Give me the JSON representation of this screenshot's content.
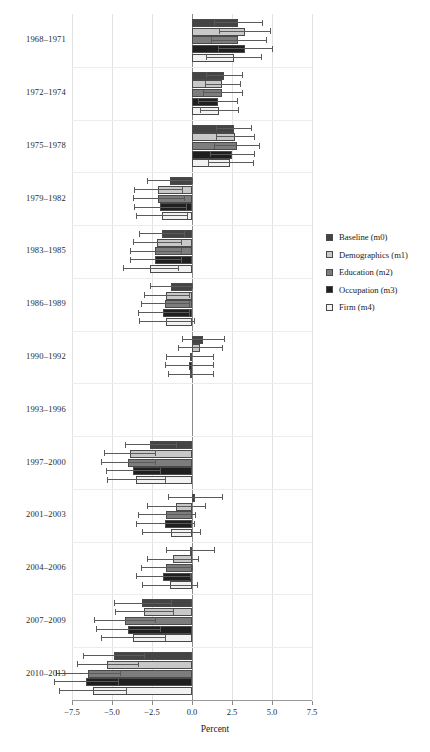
{
  "chart_data": {
    "type": "bar",
    "orientation": "horizontal",
    "title": "",
    "xlabel": "Percent",
    "ylabel": "",
    "xlim": [
      -7.5,
      7.5
    ],
    "xticks": [
      -7.5,
      -5.0,
      -2.5,
      0.0,
      2.5,
      5.0,
      7.5
    ],
    "xtick_labels": [
      "−7.5",
      "−5.0",
      "−2.5",
      "0.0",
      "2.5",
      "5.0",
      "7.5"
    ],
    "grid": true,
    "legend_position": "right",
    "error_bars": true,
    "categories": [
      "1968–1971",
      "1972–1974",
      "1975–1978",
      "1979–1982",
      "1983–1985",
      "1986–1989",
      "1990–1992",
      "1993–1996",
      "1997–2000",
      "2001–2003",
      "2004–2006",
      "2007–2009",
      "2010–2013"
    ],
    "series": [
      {
        "name": "Baseline (m0)",
        "color": "#444444",
        "values": [
          2.9,
          2.0,
          2.6,
          -1.4,
          -1.9,
          -1.3,
          0.7,
          0.0,
          -2.6,
          0.2,
          -0.1,
          -3.1,
          -4.9
        ],
        "ci_low": [
          1.4,
          0.9,
          1.5,
          -2.8,
          -3.3,
          -2.6,
          -0.6,
          0.0,
          -4.2,
          -1.5,
          -1.6,
          -4.9,
          -6.8
        ],
        "ci_high": [
          4.4,
          3.1,
          3.7,
          0.0,
          -0.5,
          0.0,
          2.0,
          0.0,
          -1.0,
          1.9,
          1.4,
          -1.3,
          -3.0
        ]
      },
      {
        "name": "Demographics (m1)",
        "color": "#c8c8c8",
        "values": [
          3.3,
          1.9,
          2.7,
          -2.1,
          -2.2,
          -1.6,
          0.5,
          0.0,
          -3.9,
          -1.0,
          -1.2,
          -3.0,
          -5.3
        ],
        "ci_low": [
          1.7,
          0.8,
          1.5,
          -3.6,
          -3.7,
          -3.0,
          -0.9,
          0.0,
          -5.5,
          -2.8,
          -2.8,
          -4.8,
          -7.2
        ],
        "ci_high": [
          4.9,
          3.0,
          3.9,
          -0.6,
          -0.7,
          -0.2,
          1.9,
          0.0,
          -2.3,
          0.8,
          0.4,
          -1.2,
          -3.4
        ]
      },
      {
        "name": "Education (m2)",
        "color": "#7d7d7d",
        "values": [
          2.9,
          1.9,
          2.8,
          -2.1,
          -2.3,
          -1.7,
          -0.15,
          0.0,
          -4.0,
          -1.6,
          -1.6,
          -4.2,
          -6.5
        ],
        "ci_low": [
          1.2,
          0.7,
          1.4,
          -3.7,
          -3.9,
          -3.2,
          -1.6,
          0.0,
          -5.7,
          -3.4,
          -3.2,
          -6.1,
          -8.5
        ],
        "ci_high": [
          4.6,
          3.1,
          4.2,
          -0.5,
          -0.7,
          -0.2,
          1.3,
          0.0,
          -2.3,
          0.2,
          0.0,
          -2.3,
          -4.5
        ]
      },
      {
        "name": "Occupation (m3)",
        "color": "#1f1f1f",
        "values": [
          3.3,
          1.6,
          2.5,
          -2.0,
          -2.3,
          -1.8,
          -0.2,
          0.0,
          -3.7,
          -1.7,
          -1.8,
          -4.0,
          -6.6
        ],
        "ci_low": [
          1.6,
          0.4,
          1.1,
          -3.6,
          -3.9,
          -3.4,
          -1.7,
          0.0,
          -5.4,
          -3.5,
          -3.5,
          -6.0,
          -8.6
        ],
        "ci_high": [
          5.0,
          2.8,
          3.9,
          -0.4,
          -0.7,
          -0.2,
          1.3,
          0.0,
          -2.0,
          0.1,
          -0.1,
          -2.0,
          -4.6
        ]
      },
      {
        "name": "Firm (m4)",
        "color": "#f2f2f2",
        "values": [
          2.6,
          1.7,
          2.4,
          -1.9,
          -2.6,
          -1.6,
          -0.1,
          0.0,
          -3.5,
          -1.3,
          -1.4,
          -3.7,
          -6.2
        ],
        "ci_low": [
          0.9,
          0.5,
          1.0,
          -3.5,
          -4.3,
          -3.3,
          -1.5,
          0.0,
          -5.3,
          -3.1,
          -3.1,
          -5.7,
          -8.3
        ],
        "ci_high": [
          4.3,
          2.9,
          3.8,
          -0.3,
          -0.9,
          0.1,
          1.3,
          0.0,
          -1.7,
          0.5,
          0.3,
          -1.7,
          -4.1
        ]
      }
    ]
  }
}
